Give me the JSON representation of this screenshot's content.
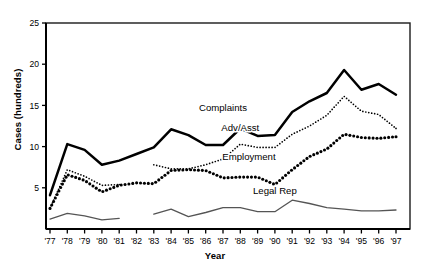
{
  "chart_data": {
    "type": "line",
    "title": "",
    "xlabel": "Year",
    "ylabel": "Cases (hundreds)",
    "ylim": [
      0,
      25
    ],
    "yticks": [
      5,
      10,
      15,
      20,
      25
    ],
    "ytick_labels": [
      "5",
      "10",
      "15",
      "20",
      "25"
    ],
    "grid": false,
    "legend": "inline-labels",
    "x": [
      1977,
      1978,
      1979,
      1980,
      1981,
      1982,
      1983,
      1984,
      1985,
      1986,
      1987,
      1988,
      1989,
      1990,
      1991,
      1992,
      1993,
      1994,
      1995,
      1996,
      1997
    ],
    "categories": [
      "'77",
      "'78",
      "'79",
      "'80",
      "'81",
      "'82",
      "'83",
      "'84",
      "'85",
      "'86",
      "'87",
      "'88",
      "'89",
      "'90",
      "'91",
      "'92",
      "'93",
      "'94",
      "'95",
      "'96",
      "'97"
    ],
    "series": [
      {
        "name": "Complaints",
        "style": "solid-thick",
        "color": "#000000",
        "values": [
          4.1,
          10.3,
          9.6,
          7.8,
          8.3,
          9.1,
          9.9,
          12.1,
          11.4,
          10.2,
          10.2,
          12.2,
          11.3,
          11.4,
          14.2,
          15.5,
          16.5,
          19.3,
          16.9,
          17.6,
          16.3
        ]
      },
      {
        "name": "Adv/Asst",
        "style": "dotted-fine",
        "color": "#000000",
        "values": [
          2.5,
          7.2,
          6.4,
          5.3,
          5.4,
          null,
          7.8,
          7.3,
          7.3,
          7.8,
          8.5,
          10.3,
          9.9,
          9.9,
          11.5,
          12.5,
          13.8,
          16.1,
          14.3,
          13.9,
          12.2
        ]
      },
      {
        "name": "Employment",
        "style": "dotted-bold",
        "color": "#000000",
        "values": [
          2.5,
          6.6,
          5.9,
          4.5,
          5.3,
          5.6,
          5.5,
          7.1,
          7.2,
          7.1,
          6.2,
          6.3,
          6.3,
          5.4,
          7.2,
          8.8,
          9.7,
          11.5,
          11.1,
          11.0,
          11.2
        ]
      },
      {
        "name": "Legal Rep",
        "style": "solid-thin-gray",
        "color": "#555555",
        "values": [
          1.2,
          1.9,
          1.6,
          1.1,
          1.3,
          null,
          1.8,
          2.4,
          1.5,
          2.0,
          2.6,
          2.6,
          2.1,
          2.1,
          3.5,
          3.1,
          2.6,
          2.4,
          2.2,
          2.2,
          2.3
        ]
      }
    ],
    "annotations": [
      {
        "text": "Complaints",
        "x": 1987,
        "y": 14.3
      },
      {
        "text": "Adv/Asst",
        "x": 1988,
        "y": 11.9
      },
      {
        "text": "Employment",
        "x": 1988.5,
        "y": 8.4
      },
      {
        "text": "Legal Rep",
        "x": 1990,
        "y": 4.3
      }
    ]
  },
  "axes": {
    "y_title": "Cases (hundreds)",
    "x_title": "Year"
  }
}
